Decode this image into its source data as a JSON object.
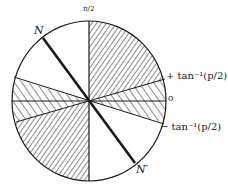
{
  "diagram": {
    "type": "angular sector diagram (circle with hatched regions)",
    "labels": {
      "top": "π/2",
      "right_zero": "o",
      "plus_angle": "+ tan⁻¹(p/2)",
      "minus_angle": "− tan⁻¹(p/2)",
      "N": "N",
      "N_prime": "N′"
    },
    "regions": [
      {
        "name": "upper-right-sector",
        "from": "π/2",
        "to": "+tan⁻¹(p/2)",
        "fill": "dense hatching"
      },
      {
        "name": "right-sector",
        "from": "+tan⁻¹(p/2)",
        "to": "−tan⁻¹(p/2)",
        "fill": "sparse hatching"
      },
      {
        "name": "lower-left-sector",
        "fill": "dense hatching"
      },
      {
        "name": "left-sector",
        "fill": "sparse hatching"
      }
    ],
    "colors": {
      "ink": "#1a1a1a",
      "background": "#ffffff"
    }
  }
}
